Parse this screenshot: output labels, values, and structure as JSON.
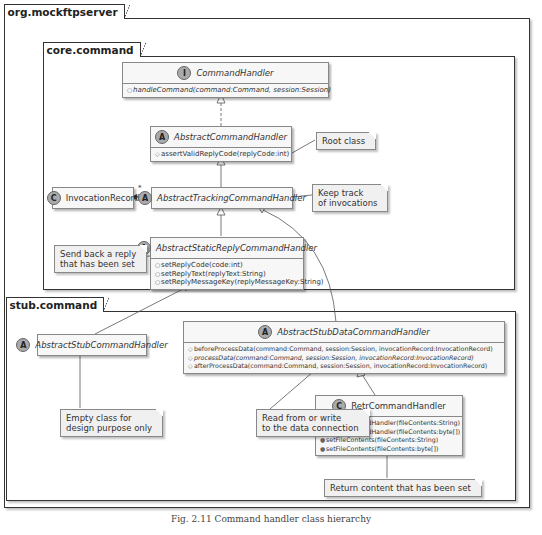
{
  "packages": {
    "outer": "org.mockftpserver",
    "core": "core.command",
    "stub": "stub.command"
  },
  "classes": {
    "command_handler": {
      "stereotype": "I",
      "name": "CommandHandler",
      "members": [
        "handleCommand(command:Command, session:Session)"
      ]
    },
    "abstract_command_handler": {
      "stereotype": "A",
      "name": "AbstractCommandHandler",
      "members": [
        "assertValidReplyCode(replyCode:int)"
      ]
    },
    "invocation_record": {
      "stereotype": "C",
      "name": "InvocationRecord"
    },
    "abstract_tracking": {
      "stereotype": "A",
      "name": "AbstractTrackingCommandHandler",
      "multiplicity": "*"
    },
    "abstract_static_reply": {
      "stereotype": "A",
      "name": "AbstractStaticReplyCommandHandler",
      "members": [
        "setReplyCode(code:int)",
        "setReplyText(replyText:String)",
        "setReplyMessageKey(replyMessageKey:String)"
      ]
    },
    "abstract_stub": {
      "stereotype": "A",
      "name": "AbstractStubCommandHandler"
    },
    "abstract_stub_data": {
      "stereotype": "A",
      "name": "AbstractStubDataCommandHandler",
      "members": [
        "beforeProcessData(command:Command, session:Session, invocationRecord:InvocationRecord)",
        "processData(command:Command, session:Session, invocationRecord:InvocationRecord)",
        "afterProcessData(command:Command, session:Session, invocationRecord:InvocationRecord)"
      ]
    },
    "retr": {
      "stereotype": "C",
      "name": "RetrCommandHandler",
      "members": [
        "RetrCommandHandler(fileContents:String)",
        "RetrCommandHandler(fileContents:byte[])",
        "setFileContents(fileContents:String)",
        "setFileContents(fileContents:byte[])"
      ]
    }
  },
  "notes": {
    "root": "Root class",
    "tracking": "Keep track\nof invocations",
    "static_reply": "Send back a reply\nthat has been set",
    "empty": "Empty class for\ndesign purpose only",
    "data": "Read from or write\nto the data connection",
    "retr": "Return content that has been set"
  },
  "caption": "Fig. 2.11   Command handler class hierarchy"
}
